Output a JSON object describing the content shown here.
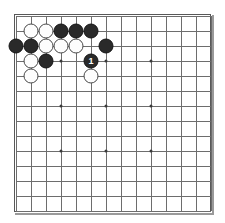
{
  "board": {
    "game": "Go",
    "size": 13,
    "grid_lines": 14,
    "line_color": "#6d6d6d",
    "border_color": "#585858",
    "background_color": "#ffffff",
    "black_color": "#2a2a2a",
    "white_color": "#fdfdfd",
    "star_point_color": "#3a3a3a",
    "star_points": [
      {
        "col": 3,
        "row": 3
      },
      {
        "col": 6,
        "row": 3
      },
      {
        "col": 9,
        "row": 3
      },
      {
        "col": 3,
        "row": 6
      },
      {
        "col": 6,
        "row": 6
      },
      {
        "col": 9,
        "row": 6
      },
      {
        "col": 3,
        "row": 9
      },
      {
        "col": 6,
        "row": 9
      },
      {
        "col": 9,
        "row": 9
      }
    ],
    "stones": [
      {
        "col": 1,
        "row": 1,
        "color": "white",
        "label": ""
      },
      {
        "col": 2,
        "row": 1,
        "color": "white",
        "label": ""
      },
      {
        "col": 3,
        "row": 1,
        "color": "black",
        "label": ""
      },
      {
        "col": 4,
        "row": 1,
        "color": "black",
        "label": ""
      },
      {
        "col": 5,
        "row": 1,
        "color": "black",
        "label": ""
      },
      {
        "col": 0,
        "row": 2,
        "color": "black",
        "label": ""
      },
      {
        "col": 1,
        "row": 2,
        "color": "black",
        "label": ""
      },
      {
        "col": 2,
        "row": 2,
        "color": "white",
        "label": ""
      },
      {
        "col": 3,
        "row": 2,
        "color": "white",
        "label": ""
      },
      {
        "col": 4,
        "row": 2,
        "color": "white",
        "label": ""
      },
      {
        "col": 6,
        "row": 2,
        "color": "black",
        "label": ""
      },
      {
        "col": 1,
        "row": 3,
        "color": "white",
        "label": ""
      },
      {
        "col": 2,
        "row": 3,
        "color": "black",
        "label": ""
      },
      {
        "col": 5,
        "row": 3,
        "color": "black",
        "label": "1"
      },
      {
        "col": 1,
        "row": 4,
        "color": "white",
        "label": ""
      },
      {
        "col": 5,
        "row": 4,
        "color": "white",
        "label": ""
      }
    ],
    "move_marker": {
      "number": "1",
      "color": "black",
      "col": 5,
      "row": 3
    }
  }
}
